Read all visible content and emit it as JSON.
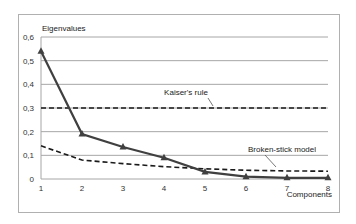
{
  "chart_data": {
    "type": "line",
    "title": "",
    "xlabel": "Components",
    "ylabel": "Eigenvalues",
    "x": [
      1,
      2,
      3,
      4,
      5,
      6,
      7,
      8
    ],
    "x_tick_labels": [
      "1",
      "2",
      "3",
      "4",
      "5",
      "6",
      "7",
      "8"
    ],
    "y_tick_labels": [
      "0",
      "0,1",
      "0,2",
      "0,3",
      "0,4",
      "0,5",
      "0,6"
    ],
    "ylim": [
      0,
      0.6
    ],
    "grid": true,
    "series": [
      {
        "name": "Eigenvalues",
        "style": "solid-triangle-markers",
        "values": [
          0.54,
          0.19,
          0.135,
          0.09,
          0.03,
          0.01,
          0.005,
          0.005
        ]
      },
      {
        "name": "Broken-stick model",
        "style": "dashed",
        "values": [
          0.14,
          0.08,
          0.065,
          0.052,
          0.043,
          0.037,
          0.034,
          0.033
        ]
      },
      {
        "name": "Kaiser's rule",
        "style": "dashed",
        "values": [
          0.3,
          0.3,
          0.3,
          0.3,
          0.3,
          0.3,
          0.3,
          0.3
        ]
      }
    ],
    "annotations": [
      {
        "text": "Kaiser's rule",
        "points_to": "Kaiser's rule"
      },
      {
        "text": "Broken-stick model",
        "points_to": "Broken-stick model"
      }
    ],
    "legend_position": "none"
  },
  "labels": {
    "y_axis_title": "Eigenvalues",
    "x_axis_title": "Components",
    "kaiser_annotation": "Kaiser's rule",
    "broken_stick_annotation": "Broken-stick model"
  },
  "colors": {
    "series_line": "#404040",
    "dashed_line": "#1a1a1a",
    "grid": "#a6a6a6",
    "frame": "#b0b0b0"
  }
}
